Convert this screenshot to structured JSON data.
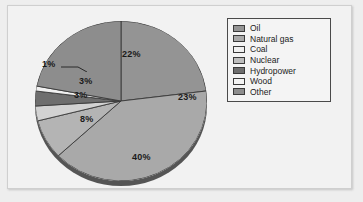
{
  "chart_data": {
    "type": "pie",
    "title": "",
    "labels": [
      "Oil",
      "Natural gas",
      "Coal",
      "Nuclear",
      "Hydropower",
      "Wood",
      "Other"
    ],
    "values": [
      23,
      40,
      8,
      3,
      3,
      1,
      22
    ],
    "value_labels": [
      "23%",
      "40%",
      "8%",
      "3%",
      "3%",
      "1%",
      "22%"
    ],
    "unit": "%",
    "colors": [
      "#949494",
      "#a9a9a9",
      "#b4b4b4",
      "#d2d2d2",
      "#6e6e6e",
      "#f0f0f0",
      "#8d8d8d"
    ],
    "legend_position": "top-right",
    "grid": false,
    "start_angle_deg": 0,
    "direction": "clockwise",
    "style": "3d-pie",
    "rim_color": "#555555",
    "outline_color": "#3a3a3a"
  },
  "legend": {
    "items": [
      {
        "label": "Oil",
        "swatch": "#949494"
      },
      {
        "label": "Natural gas",
        "swatch": "#a9a9a9"
      },
      {
        "label": "Coal",
        "swatch": "#f0f0f0"
      },
      {
        "label": "Nuclear",
        "swatch": "#bdbdbd"
      },
      {
        "label": "Hydropower",
        "swatch": "#6e6e6e"
      },
      {
        "label": "Wood",
        "swatch": "#f4f4f4"
      },
      {
        "label": "Other",
        "swatch": "#8d8d8d"
      }
    ]
  },
  "slice_labels": {
    "oil": "23%",
    "natural_gas": "40%",
    "coal": "8%",
    "nuclear": "3%",
    "hydropower": "3%",
    "wood": "1%",
    "other": "22%"
  }
}
